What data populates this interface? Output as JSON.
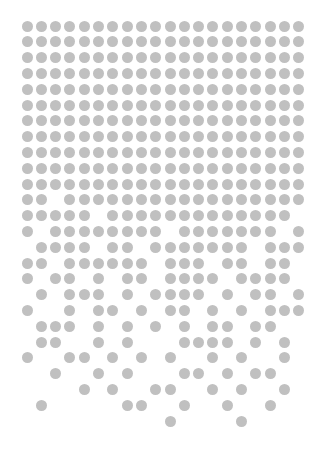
{
  "pattern": {
    "description": "Dot grid that dissolves from top to bottom",
    "dot_color": "#c0c0c0",
    "background": "#ffffff",
    "dot_diameter": 11,
    "columns": 20,
    "rows": 26,
    "origin_x": 27,
    "origin_y": 26,
    "col_spacing": 14.3,
    "row_spacing": 15.8,
    "rows_filled_columns": [
      [
        0,
        1,
        2,
        3,
        4,
        5,
        6,
        7,
        8,
        9,
        10,
        11,
        12,
        13,
        14,
        15,
        16,
        17,
        18,
        19
      ],
      [
        0,
        1,
        2,
        3,
        4,
        5,
        6,
        7,
        8,
        9,
        10,
        11,
        12,
        13,
        14,
        15,
        16,
        17,
        18,
        19
      ],
      [
        0,
        1,
        2,
        3,
        4,
        5,
        6,
        7,
        8,
        9,
        10,
        11,
        12,
        13,
        14,
        15,
        16,
        17,
        18,
        19
      ],
      [
        0,
        1,
        2,
        3,
        4,
        5,
        6,
        7,
        8,
        9,
        10,
        11,
        12,
        13,
        14,
        15,
        16,
        17,
        18,
        19
      ],
      [
        0,
        1,
        2,
        3,
        4,
        5,
        6,
        7,
        8,
        9,
        10,
        11,
        12,
        13,
        14,
        15,
        16,
        17,
        18,
        19
      ],
      [
        0,
        1,
        2,
        3,
        4,
        5,
        6,
        7,
        8,
        9,
        10,
        11,
        12,
        13,
        14,
        15,
        16,
        17,
        18,
        19
      ],
      [
        0,
        1,
        2,
        3,
        4,
        5,
        6,
        7,
        8,
        9,
        10,
        11,
        12,
        13,
        14,
        15,
        16,
        17,
        18,
        19
      ],
      [
        0,
        1,
        2,
        3,
        4,
        5,
        6,
        7,
        8,
        9,
        10,
        11,
        12,
        13,
        14,
        15,
        16,
        17,
        18,
        19
      ],
      [
        0,
        1,
        2,
        3,
        4,
        5,
        6,
        7,
        8,
        9,
        10,
        11,
        12,
        13,
        14,
        15,
        16,
        17,
        18,
        19
      ],
      [
        0,
        1,
        2,
        3,
        4,
        5,
        6,
        7,
        8,
        9,
        10,
        11,
        12,
        13,
        14,
        15,
        16,
        17,
        18,
        19
      ],
      [
        0,
        1,
        2,
        3,
        4,
        5,
        6,
        7,
        8,
        9,
        10,
        11,
        12,
        13,
        14,
        15,
        16,
        17,
        18,
        19
      ],
      [
        0,
        1,
        3,
        4,
        5,
        6,
        7,
        8,
        9,
        10,
        11,
        12,
        13,
        14,
        15,
        16,
        17,
        18,
        19
      ],
      [
        0,
        1,
        2,
        3,
        4,
        6,
        7,
        8,
        9,
        10,
        11,
        12,
        13,
        14,
        15,
        16,
        17,
        18
      ],
      [
        0,
        2,
        3,
        4,
        5,
        6,
        7,
        8,
        9,
        11,
        12,
        13,
        14,
        15,
        16,
        17,
        19
      ],
      [
        1,
        2,
        3,
        4,
        6,
        7,
        9,
        10,
        11,
        12,
        13,
        14,
        15,
        17,
        18,
        19
      ],
      [
        0,
        1,
        3,
        4,
        5,
        6,
        7,
        8,
        10,
        11,
        12,
        14,
        15,
        17,
        18
      ],
      [
        0,
        2,
        3,
        5,
        7,
        8,
        10,
        11,
        12,
        13,
        15,
        16,
        17,
        18
      ],
      [
        1,
        3,
        4,
        5,
        7,
        9,
        10,
        11,
        12,
        14,
        16,
        17,
        19
      ],
      [
        0,
        3,
        5,
        6,
        8,
        10,
        11,
        13,
        15,
        17,
        18,
        19
      ],
      [
        1,
        2,
        3,
        5,
        7,
        9,
        11,
        13,
        14,
        16,
        17
      ],
      [
        1,
        2,
        5,
        7,
        11,
        12,
        13,
        14,
        16,
        18
      ],
      [
        0,
        3,
        4,
        6,
        8,
        10,
        13,
        15,
        18
      ],
      [
        2,
        5,
        7,
        11,
        12,
        14,
        16,
        17
      ],
      [
        4,
        6,
        9,
        10,
        13,
        15,
        18
      ],
      [
        1,
        7,
        8,
        11,
        14,
        17
      ],
      [
        10,
        15
      ]
    ]
  }
}
